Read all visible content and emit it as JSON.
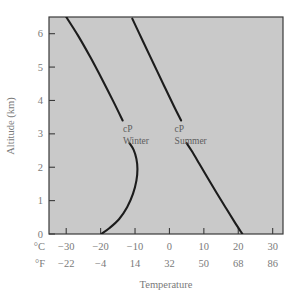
{
  "chart_data": {
    "type": "line",
    "title": "",
    "xlabel": "Temperature",
    "ylabel": "Altitude (km)",
    "xlim": [
      -35,
      33
    ],
    "ylim": [
      0,
      6.5
    ],
    "grid": false,
    "legend": "none",
    "background_color": "#c9c9c9",
    "line_color": "#1c1c1c",
    "text_color": "#7a7a7a",
    "x_axes": [
      {
        "unit_label": "°C",
        "tick_values": [
          -30,
          -20,
          -10,
          0,
          10,
          20,
          30
        ],
        "tick_labels": [
          "−30",
          "−20",
          "−10",
          "0",
          "10",
          "20",
          "30"
        ]
      },
      {
        "unit_label": "°F",
        "tick_values": [
          -22,
          -4,
          14,
          32,
          50,
          68,
          86
        ],
        "tick_labels": [
          "−22",
          "−4",
          "14",
          "32",
          "50",
          "68",
          "86"
        ]
      }
    ],
    "y_axis": {
      "tick_values": [
        0,
        1,
        2,
        3,
        4,
        5,
        6
      ],
      "tick_labels": [
        "0",
        "1",
        "2",
        "3",
        "4",
        "5",
        "6"
      ]
    },
    "series": [
      {
        "name": "cP Winter",
        "label_line1": "cP",
        "label_line2": "Winter",
        "label_temp_c": -13.5,
        "label_altitude_km": 3.05,
        "segments": [
          {
            "part": "lower",
            "comment": "surface inversion branch: cold at surface, warms with height, then cools",
            "points": [
              [
                -19.8,
                0.0
              ],
              [
                -17.4,
                0.18
              ],
              [
                -14.6,
                0.45
              ],
              [
                -12.3,
                0.8
              ],
              [
                -10.6,
                1.2
              ],
              [
                -9.6,
                1.6
              ],
              [
                -9.3,
                1.95
              ],
              [
                -9.6,
                2.25
              ],
              [
                -10.4,
                2.52
              ],
              [
                -11.6,
                2.72
              ]
            ]
          },
          {
            "part": "upper",
            "comment": "upper tropospheric lapse branch",
            "points": [
              [
                -13.6,
                3.4
              ],
              [
                -16.2,
                3.95
              ],
              [
                -19.4,
                4.6
              ],
              [
                -23.0,
                5.3
              ],
              [
                -26.6,
                5.95
              ],
              [
                -30.6,
                6.6
              ]
            ]
          }
        ]
      },
      {
        "name": "cP Summer",
        "label_line1": "cP",
        "label_line2": "Summer",
        "label_temp_c": 1.5,
        "label_altitude_km": 3.05,
        "segments": [
          {
            "part": "lower",
            "comment": "near-linear lapse from warm surface",
            "points": [
              [
                21.2,
                0.0
              ],
              [
                19.0,
                0.35
              ],
              [
                16.4,
                0.78
              ],
              [
                13.6,
                1.25
              ],
              [
                11.0,
                1.7
              ],
              [
                8.6,
                2.12
              ],
              [
                6.4,
                2.5
              ],
              [
                5.0,
                2.72
              ]
            ]
          },
          {
            "part": "upper",
            "comment": "continues aloft above label gap",
            "points": [
              [
                3.4,
                3.4
              ],
              [
                1.2,
                3.85
              ],
              [
                -1.6,
                4.45
              ],
              [
                -4.6,
                5.1
              ],
              [
                -7.6,
                5.75
              ],
              [
                -10.8,
                6.45
              ]
            ]
          }
        ]
      }
    ]
  }
}
